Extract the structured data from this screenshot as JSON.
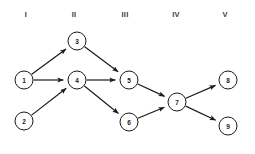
{
  "diagram": {
    "type": "directed-network-graph",
    "width": 255,
    "height": 154,
    "background_color": "#ffffff",
    "stroke_color": "#1a1a1a",
    "label_color": "#3a3a3a",
    "column_labels": [
      {
        "id": "col-1",
        "text": "I",
        "x": 26,
        "y": 15
      },
      {
        "id": "col-2",
        "text": "II",
        "x": 74,
        "y": 15
      },
      {
        "id": "col-3",
        "text": "III",
        "x": 125,
        "y": 15
      },
      {
        "id": "col-4",
        "text": "IV",
        "x": 176,
        "y": 15
      },
      {
        "id": "col-5",
        "text": "V",
        "x": 225,
        "y": 15
      }
    ],
    "nodes": [
      {
        "id": "node-1",
        "label": "1",
        "x": 24,
        "y": 80,
        "r": 9,
        "column": "I"
      },
      {
        "id": "node-2",
        "label": "2",
        "x": 24,
        "y": 121,
        "r": 9,
        "column": "I"
      },
      {
        "id": "node-3",
        "label": "3",
        "x": 77,
        "y": 41,
        "r": 9,
        "column": "II"
      },
      {
        "id": "node-4",
        "label": "4",
        "x": 77,
        "y": 80,
        "r": 9,
        "column": "II"
      },
      {
        "id": "node-5",
        "label": "5",
        "x": 129,
        "y": 80,
        "r": 9,
        "column": "III"
      },
      {
        "id": "node-6",
        "label": "6",
        "x": 129,
        "y": 122,
        "r": 9,
        "column": "III"
      },
      {
        "id": "node-7",
        "label": "7",
        "x": 177,
        "y": 102,
        "r": 9,
        "column": "IV"
      },
      {
        "id": "node-8",
        "label": "8",
        "x": 228,
        "y": 80,
        "r": 9,
        "column": "V"
      },
      {
        "id": "node-9",
        "label": "9",
        "x": 228,
        "y": 126,
        "r": 9,
        "column": "V"
      }
    ],
    "edges": [
      {
        "id": "edge-1-3",
        "from": "1",
        "to": "3"
      },
      {
        "id": "edge-1-4",
        "from": "1",
        "to": "4"
      },
      {
        "id": "edge-2-4",
        "from": "2",
        "to": "4"
      },
      {
        "id": "edge-3-5",
        "from": "3",
        "to": "5"
      },
      {
        "id": "edge-4-5",
        "from": "4",
        "to": "5"
      },
      {
        "id": "edge-4-6",
        "from": "4",
        "to": "6"
      },
      {
        "id": "edge-5-7",
        "from": "5",
        "to": "7"
      },
      {
        "id": "edge-6-7",
        "from": "6",
        "to": "7"
      },
      {
        "id": "edge-7-8",
        "from": "7",
        "to": "8"
      },
      {
        "id": "edge-7-9",
        "from": "7",
        "to": "9"
      }
    ]
  }
}
